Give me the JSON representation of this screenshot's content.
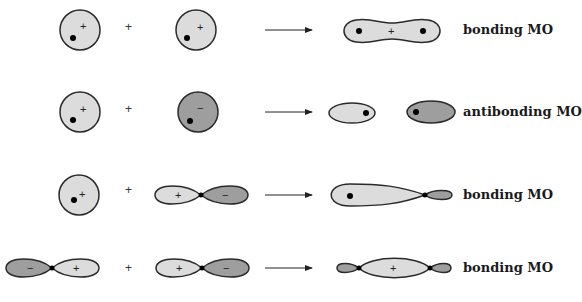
{
  "colors": {
    "positive_fill": "#dcdcdc",
    "negative_fill": "#9e9e9e",
    "outline": "#2a2a2a",
    "nucleus": "#000000"
  },
  "operators": {
    "plus": "+"
  },
  "signs": {
    "positive": "+",
    "negative": "−"
  },
  "rows": [
    {
      "id": "s-plus-s-bonding",
      "left": "s orbital (+)",
      "right": "s orbital (+)",
      "result_label": "bonding MO"
    },
    {
      "id": "s-plus-s-antibonding",
      "left": "s orbital (+)",
      "right": "s orbital (−)",
      "result_label": "antibonding MO"
    },
    {
      "id": "s-plus-p-bonding",
      "left": "s orbital (+)",
      "right": "p orbital (+/−)",
      "result_label": "bonding MO"
    },
    {
      "id": "p-plus-p-bonding",
      "left": "p orbital (−/+)",
      "right": "p orbital (+/−)",
      "result_label": "bonding MO"
    }
  ]
}
